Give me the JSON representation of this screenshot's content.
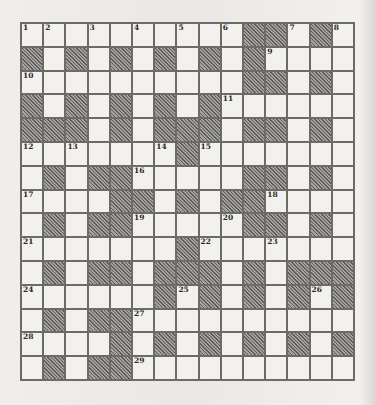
{
  "puzzle": {
    "rows": 15,
    "cols": 15,
    "colors": {
      "white_cell": "#f2f1ee",
      "block_cell": "#8a8986",
      "grid_line": "#6c6b68",
      "number_text": "#2a2a28"
    },
    "layout": [
      "WWWWWWWWWWBBWBW",
      "BWBWBWBWBWBWWWW",
      "WWWWWWWWWWBBWBW",
      "BWBWBWBWBWWWWWW",
      "BBBWBWBBBWBBWBW",
      "WWWWWWWBWWWWWWW",
      "WBWBBWWWWWBBWBW",
      "WWWWBBWBWBBWWWW",
      "WBWBBWWWWWBBWBW",
      "WWWWWWWBWWWWWWW",
      "WBWBBWBBBWBWBBB",
      "WWWWWWBWBWBWBWB",
      "WBWBBWWWWWWWWWW",
      "WWWWBWBWBWBWBWB",
      "WBWBBWWWWWWWWWW"
    ],
    "numbers": [
      {
        "row": 0,
        "col": 0,
        "n": "1"
      },
      {
        "row": 0,
        "col": 1,
        "n": "2"
      },
      {
        "row": 0,
        "col": 3,
        "n": "3"
      },
      {
        "row": 0,
        "col": 5,
        "n": "4"
      },
      {
        "row": 0,
        "col": 7,
        "n": "5"
      },
      {
        "row": 0,
        "col": 9,
        "n": "6"
      },
      {
        "row": 0,
        "col": 12,
        "n": "7"
      },
      {
        "row": 0,
        "col": 14,
        "n": "8"
      },
      {
        "row": 1,
        "col": 11,
        "n": "9"
      },
      {
        "row": 2,
        "col": 0,
        "n": "10"
      },
      {
        "row": 3,
        "col": 9,
        "n": "11"
      },
      {
        "row": 5,
        "col": 0,
        "n": "12"
      },
      {
        "row": 5,
        "col": 2,
        "n": "13"
      },
      {
        "row": 5,
        "col": 6,
        "n": "14"
      },
      {
        "row": 5,
        "col": 8,
        "n": "15"
      },
      {
        "row": 6,
        "col": 5,
        "n": "16"
      },
      {
        "row": 7,
        "col": 0,
        "n": "17"
      },
      {
        "row": 7,
        "col": 11,
        "n": "18"
      },
      {
        "row": 8,
        "col": 5,
        "n": "19"
      },
      {
        "row": 8,
        "col": 9,
        "n": "20"
      },
      {
        "row": 9,
        "col": 0,
        "n": "21"
      },
      {
        "row": 9,
        "col": 8,
        "n": "22"
      },
      {
        "row": 9,
        "col": 11,
        "n": "23"
      },
      {
        "row": 11,
        "col": 0,
        "n": "24"
      },
      {
        "row": 11,
        "col": 7,
        "n": "25"
      },
      {
        "row": 11,
        "col": 13,
        "n": "26"
      },
      {
        "row": 12,
        "col": 5,
        "n": "27"
      },
      {
        "row": 13,
        "col": 0,
        "n": "28"
      },
      {
        "row": 14,
        "col": 5,
        "n": "29"
      }
    ]
  }
}
